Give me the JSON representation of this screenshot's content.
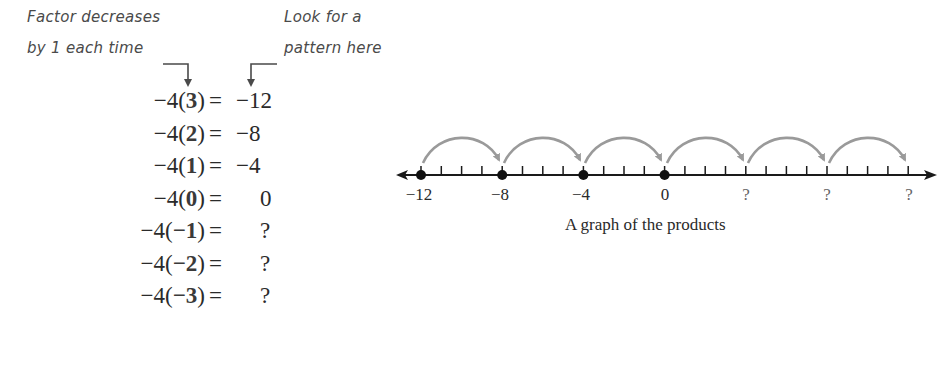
{
  "annotations": {
    "left_note_line1": "Factor decreases",
    "left_note_line2": "by 1 each time",
    "right_note_line1": "Look for a",
    "right_note_line2": "pattern here"
  },
  "equations": [
    {
      "coef": "−4",
      "factor": "3",
      "equals": "=",
      "result": "−12"
    },
    {
      "coef": "−4",
      "factor": "2",
      "equals": "=",
      "result": "−8"
    },
    {
      "coef": "−4",
      "factor": "1",
      "equals": "=",
      "result": "−4"
    },
    {
      "coef": "−4",
      "factor": "0",
      "equals": "=",
      "result": "0"
    },
    {
      "coef": "−4",
      "factor": "−1",
      "equals": "=",
      "result": "?"
    },
    {
      "coef": "−4",
      "factor": "−2",
      "equals": "=",
      "result": "?"
    },
    {
      "coef": "−4",
      "factor": "−3",
      "equals": "=",
      "result": "?"
    }
  ],
  "number_line": {
    "caption": "A graph of the products",
    "labels": [
      "−12",
      "−8",
      "−4",
      "0",
      "?",
      "?",
      "?"
    ],
    "plotted_points": [
      "−12",
      "−8",
      "−4",
      "0"
    ],
    "jump_size": 4,
    "arrow_color": "#9a9a9a",
    "axis_color": "#1a1a1a"
  }
}
